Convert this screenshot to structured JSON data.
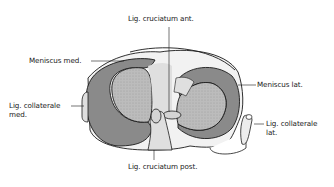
{
  "diagram": {
    "type": "anatomical illustration",
    "colors": {
      "meniscus_fill": "#8a8a8a",
      "plateau_fill": "#b9b9b9",
      "outline": "#1a1a1a",
      "ligament_fill": "#e6e6e6",
      "background": "#ffffff"
    },
    "labels": {
      "lig_cruciatum_ant": "Lig. cruciatum ant.",
      "meniscus_med": "Meniscus med.",
      "meniscus_lat": "Meniscus lat.",
      "lig_collaterale_med_line1": "Lig. collaterale",
      "lig_collaterale_med_line2": "med.",
      "lig_collaterale_lat_line1": "Lig. collaterale",
      "lig_collaterale_lat_line2": "lat.",
      "lig_cruciatum_post": "Lig. cruciatum post."
    }
  }
}
